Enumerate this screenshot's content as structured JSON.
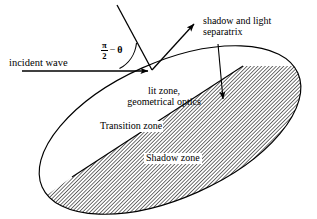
{
  "figure": {
    "type": "optics-scattering-diagram",
    "width": 317,
    "height": 219,
    "background_color": "#ffffff",
    "line_color": "#000000"
  },
  "labels": {
    "incident_wave": "incident wave",
    "separatrix": "shadow and light\nseparatrix",
    "lit_zone": "lit zone,\ngeometrical optics",
    "transition_zone": "Transition zone",
    "shadow_zone": "Shadow zone",
    "angle_numerator": "π",
    "angle_denominator": "2",
    "angle_minus": "−",
    "angle_theta": "θ"
  },
  "geometry": {
    "ellipse": {
      "center_x": 170,
      "center_y": 130,
      "radius_x": 140,
      "radius_y": 68,
      "rotation_deg": -24
    },
    "vertex_x": 152,
    "vertex_y": 71,
    "incident_arrow": {
      "x1": 22,
      "y1": 71,
      "x2": 150,
      "y2": 71
    },
    "incoming_ray": {
      "x1": 117,
      "y1": 5,
      "x2": 152,
      "y2": 70
    },
    "outgoing_ray": {
      "x1": 152,
      "y1": 70,
      "x2": 196,
      "y2": 22
    },
    "separatrix_arrow": {
      "x1": 218,
      "y1": 44,
      "x2": 223,
      "y2": 101
    },
    "shadow_boundary": {
      "x1": 243,
      "y1": 66,
      "x2": 72,
      "y2": 177
    }
  },
  "styles": {
    "hatch_angle_deg": 45,
    "hatch_spacing_px": 2,
    "hatch_color": "#000000"
  }
}
